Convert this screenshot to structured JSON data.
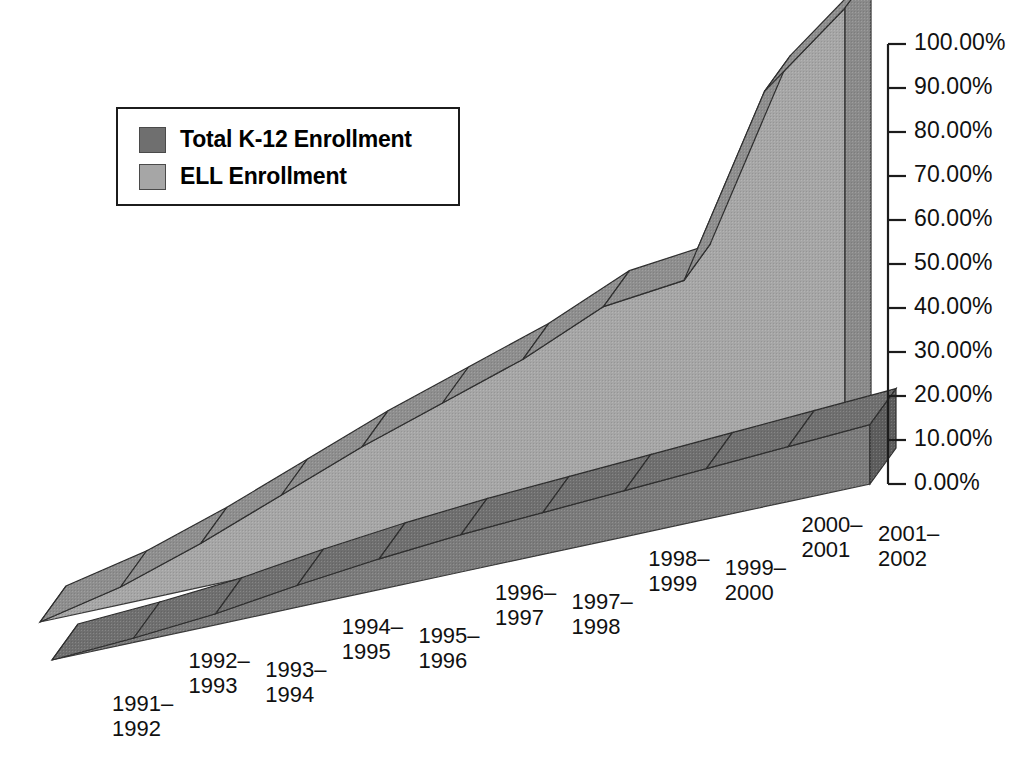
{
  "chart_data": {
    "type": "area",
    "title": "",
    "subtitle": "",
    "xlabel": "",
    "ylabel": "",
    "grid": false,
    "legend_position": "top-left",
    "style": "3d-ribbon-area",
    "ylim": [
      0,
      100
    ],
    "ytick_labels": [
      "100.00%",
      "90.00%",
      "80.00%",
      "70.00%",
      "60.00%",
      "50.00%",
      "40.00%",
      "30.00%",
      "20.00%",
      "10.00%",
      "0.00%"
    ],
    "ytick_values": [
      100,
      90,
      80,
      70,
      60,
      50,
      40,
      30,
      20,
      10,
      0
    ],
    "categories": [
      "1991–1992",
      "1992–1993",
      "1993–1994",
      "1994–1995",
      "1995–1996",
      "1996–1997",
      "1997–1998",
      "1998–1999",
      "1999–2000",
      "2000–2001",
      "2001–2002"
    ],
    "categories_lines": [
      [
        "1991–",
        "1992"
      ],
      [
        "1992–",
        "1993"
      ],
      [
        "1993–",
        "1994"
      ],
      [
        "1994–",
        "1995"
      ],
      [
        "1995–",
        "1996"
      ],
      [
        "1996–",
        "1997"
      ],
      [
        "1997–",
        "1998"
      ],
      [
        "1998–",
        "1999"
      ],
      [
        "1999–",
        "2000"
      ],
      [
        "2000–",
        "2001"
      ],
      [
        "2001–",
        "2002"
      ]
    ],
    "series": [
      {
        "name": "Total K-12 Enrollment",
        "color": "#6f6f6f",
        "values": [
          0.0,
          1.0,
          2.5,
          5.0,
          7.0,
          8.5,
          9.5,
          10.5,
          11.5,
          12.5,
          13.5
        ]
      },
      {
        "name": "ELL Enrollment",
        "color": "#a6a6a6",
        "values": [
          0.0,
          4.0,
          10.0,
          17.0,
          24.0,
          30.0,
          36.0,
          44.0,
          46.0,
          85.0,
          100.0
        ]
      }
    ]
  },
  "legend": {
    "items": [
      {
        "label": "Total K-12 Enrollment",
        "color": "#6f6f6f"
      },
      {
        "label": "ELL Enrollment",
        "color": "#a6a6a6"
      }
    ]
  },
  "axis": {
    "y_min_label": "0.00%",
    "y_max_label": "100.00%"
  },
  "colors": {
    "background": "#ffffff",
    "axis": "#1c1c1c",
    "text": "#111111",
    "series_total_top": "#6f6f6f",
    "series_total_face": "#7b7b7b",
    "series_total_side": "#5d5d5d",
    "series_ell_top": "#8e8e8e",
    "series_ell_face": "#a6a6a6",
    "series_ell_side": "#8a8a8a"
  }
}
